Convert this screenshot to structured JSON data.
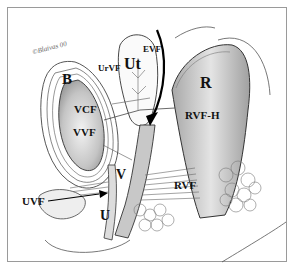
{
  "figure": {
    "type": "anatomical illustration",
    "signature": "©Blaivas 00",
    "labels": {
      "B": "B",
      "VCF": "VCF",
      "VVF": "VVF",
      "UrVF": "UrVF",
      "Ut": "Ut",
      "EVF": "EVF",
      "R": "R",
      "RVF_H": "RVF-H",
      "RVF": "RVF",
      "V": "V",
      "UVF": "UVF",
      "U": "U"
    },
    "colors": {
      "line": "#333333",
      "organ_fill": "#b8b8b8",
      "frame": "#9a9a9a"
    }
  }
}
